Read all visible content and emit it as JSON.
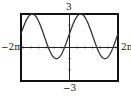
{
  "chart_data": {
    "type": "line",
    "title": "",
    "xlabel": "",
    "ylabel": "",
    "xlim": [
      "-2π",
      "2π"
    ],
    "ylim": [
      -3,
      3
    ],
    "x_tick_labels": [
      "-2π",
      "2π"
    ],
    "y_tick_labels": [
      "3",
      "-3"
    ],
    "grid": false,
    "series": [
      {
        "name": "y ≈ 1 + 2 sin(x)",
        "x": [
          -6.28,
          -5.5,
          -4.71,
          -3.93,
          -3.14,
          -2.36,
          -1.57,
          -0.79,
          0,
          0.79,
          1.57,
          2.36,
          3.14,
          3.93,
          4.71,
          5.5,
          6.28
        ],
        "y": [
          1.0,
          2.41,
          3.0,
          2.41,
          1.0,
          -0.41,
          -1.0,
          -0.41,
          1.0,
          2.41,
          3.0,
          2.41,
          1.0,
          -0.41,
          -1.0,
          -0.41,
          1.0
        ]
      }
    ]
  },
  "labels": {
    "ymax": "3",
    "ymin": "−3",
    "xmin": "−2π",
    "xmax": "2π"
  },
  "colors": {
    "frame": "#111111",
    "curve": "#333333"
  }
}
